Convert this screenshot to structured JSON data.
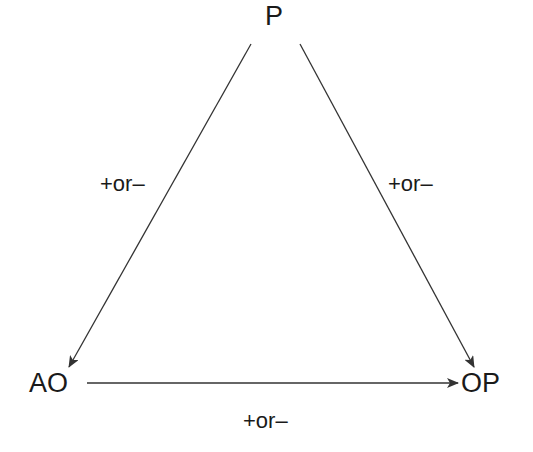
{
  "diagram": {
    "nodes": {
      "p": "P",
      "ao": "AO",
      "op": "OP"
    },
    "edges": [
      {
        "from": "P",
        "to": "AO",
        "label": "+or–"
      },
      {
        "from": "P",
        "to": "OP",
        "label": "+or–"
      },
      {
        "from": "AO",
        "to": "OP",
        "label": "+or–"
      }
    ],
    "line_color": "#333333"
  }
}
